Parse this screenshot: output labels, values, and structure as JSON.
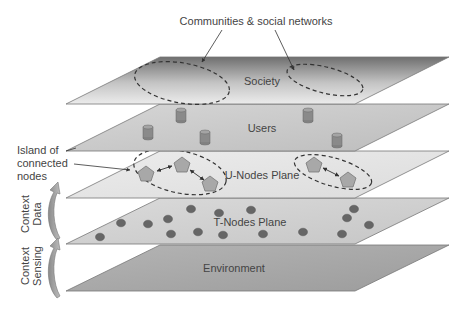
{
  "title_annotation": "Communities & social networks",
  "island_annotation": [
    "Island of",
    "connected",
    "nodes"
  ],
  "planes": [
    {
      "id": "society",
      "label": "Society",
      "top": 57,
      "bottom": 104
    },
    {
      "id": "users",
      "label": "Users",
      "top": 104,
      "bottom": 151
    },
    {
      "id": "u-nodes",
      "label": "U-Nodes Plane",
      "top": 151,
      "bottom": 198
    },
    {
      "id": "t-nodes",
      "label": "T-Nodes Plane",
      "top": 198,
      "bottom": 244
    },
    {
      "id": "environment",
      "label": "Environment",
      "top": 245,
      "bottom": 291
    }
  ],
  "side_labels": {
    "context_data": [
      "Context",
      "Data"
    ],
    "context_sensing": [
      "Context",
      "Sensing"
    ]
  },
  "users": {
    "cylinders": [
      [
        181,
        110
      ],
      [
        308,
        110
      ],
      [
        148,
        127
      ],
      [
        205,
        132
      ],
      [
        337,
        135
      ]
    ]
  },
  "u_nodes": {
    "islands": [
      {
        "cx": 180,
        "cy": 170,
        "rx": 46,
        "ry": 21,
        "rot": 15,
        "nodes": [
          [
            146,
            175
          ],
          [
            182,
            165
          ],
          [
            210,
            185
          ]
        ]
      },
      {
        "cx": 335,
        "cy": 172,
        "rx": 38,
        "ry": 14,
        "rot": 18,
        "nodes": [
          [
            315,
            165
          ],
          [
            348,
            180
          ]
        ]
      }
    ]
  },
  "t_nodes": {
    "dots": [
      [
        191,
        209
      ],
      [
        219,
        213
      ],
      [
        251,
        210
      ],
      [
        347,
        218
      ],
      [
        354,
        209
      ],
      [
        121,
        223
      ],
      [
        148,
        224
      ],
      [
        168,
        219
      ],
      [
        369,
        225
      ],
      [
        100,
        237
      ],
      [
        171,
        234
      ],
      [
        198,
        232
      ],
      [
        223,
        235
      ],
      [
        263,
        234
      ],
      [
        303,
        232
      ],
      [
        342,
        234
      ]
    ]
  },
  "colors": {
    "plane_edge": "#6a6a6a",
    "society_dark": "#7a7a7a",
    "society_light": "#e6e6e6",
    "users": "#c8c8c8",
    "u_nodes": "#e4e4e4",
    "t_nodes": "#d0d0d0",
    "environment": "#a8a8a8",
    "node_fill": "#a6a6a6",
    "dot_fill": "#666666",
    "cylinder_fill": "#8a8a8a"
  }
}
